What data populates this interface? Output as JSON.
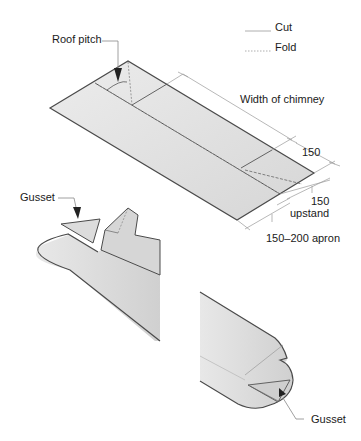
{
  "legend": {
    "cut_label": "Cut",
    "fold_label": "Fold"
  },
  "labels": {
    "roof_pitch": "Roof pitch",
    "width_of_chimney": "Width of chimney",
    "dim_150_top": "150",
    "dim_150_upstand_value": "150",
    "dim_upstand": "upstand",
    "dim_apron": "150–200 apron",
    "gusset_top": "Gusset",
    "gusset_bottom": "Gusset"
  },
  "colors": {
    "sheet_fill": "#e4e4e4",
    "sheet_shade": "#d2d2d2",
    "outline": "#4a4a4a",
    "dim_line": "#9a9a9a",
    "text": "#1a1a1a"
  }
}
